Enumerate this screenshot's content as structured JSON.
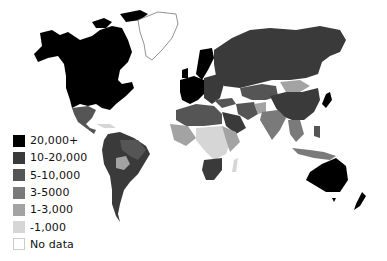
{
  "map": {
    "type": "choropleth-world",
    "colors": {
      "ocean": "#ffffff",
      "border": "#bdbdbd"
    }
  },
  "legend": {
    "items": [
      {
        "label": "20,000+",
        "color": "#000000"
      },
      {
        "label": "10-20,000",
        "color": "#3a3a3a"
      },
      {
        "label": "5-10,000",
        "color": "#555555"
      },
      {
        "label": "3-5000",
        "color": "#7a7a7a"
      },
      {
        "label": "1-3,000",
        "color": "#a3a3a3"
      },
      {
        "label": "-1,000",
        "color": "#d6d6d6"
      },
      {
        "label": "No data",
        "color": "#ffffff"
      }
    ]
  }
}
